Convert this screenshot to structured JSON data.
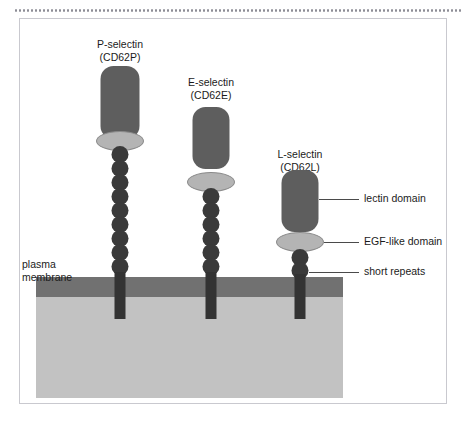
{
  "figure": {
    "background_color": "#ffffff",
    "frame_color": "#c9c9cf",
    "dotted_rule_color": "#8d8d96"
  },
  "cell": {
    "membrane_label_line1": "plasma",
    "membrane_label_line2": "membrane",
    "membrane_color": "#717171",
    "cytoplasm_color": "#c2c2c2"
  },
  "palette": {
    "lectin_domain_color": "#5e5e5e",
    "egf_domain_color": "#b4b4b4",
    "egf_domain_border": "#8a8a8a",
    "short_repeat_color": "#3a3a3a",
    "stalk_color": "#333333",
    "text_color": "#1b1b1b",
    "leader_line_color": "#4a4a4a"
  },
  "molecules": [
    {
      "id": "p-selectin",
      "name": "P-selectin",
      "cd_designation": "(CD62P)",
      "short_repeat_count": 9,
      "lectin_height": 73,
      "tallest": true
    },
    {
      "id": "e-selectin",
      "name": "E-selectin",
      "cd_designation": "(CD62E)",
      "short_repeat_count": 6,
      "lectin_height": 62,
      "tallest": false
    },
    {
      "id": "l-selectin",
      "name": "L-selectin",
      "cd_designation": "(CD62L)",
      "short_repeat_count": 2,
      "lectin_height": 62,
      "tallest": false
    }
  ],
  "annotations": [
    {
      "id": "lectin-domain",
      "label": "lectin domain"
    },
    {
      "id": "egf-like-domain",
      "label": "EGF-like domain"
    },
    {
      "id": "short-repeats",
      "label": "short repeats"
    }
  ]
}
